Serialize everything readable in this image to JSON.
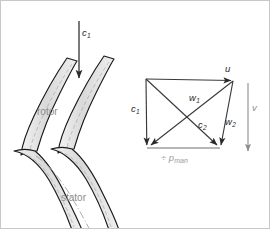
{
  "figure": {
    "type": "turbomachinery-cascade-velocity-triangle",
    "background": "#ffffff",
    "border_color": "#c8c8c8",
    "width": 270,
    "height": 229
  },
  "cascade": {
    "inlet_arrow": {
      "label": "c",
      "sub": "1",
      "name": "inlet-absolute-velocity",
      "x": 78,
      "y1": 20,
      "y2": 78,
      "color": "#2b2b2b"
    },
    "rotor_label": "rotor",
    "stator_label": "stator",
    "blade_fill": "#dcdcdc",
    "blade_stroke": "#1a1a1a",
    "centerline_color": "#9a9a9a",
    "label_color": "#8c8c8c"
  },
  "triangle": {
    "vertices": {
      "top_left": {
        "x": 145,
        "y": 78
      },
      "top_right": {
        "x": 232,
        "y": 80
      },
      "bottom_right": {
        "x": 219,
        "y": 147
      },
      "bottom_left": {
        "x": 146,
        "y": 147
      }
    },
    "stroke": "#3a3a3a",
    "vectors": [
      {
        "name": "blade-speed-u",
        "label": "u",
        "sub": "",
        "lx": 224,
        "ly": 64
      },
      {
        "name": "absolute-velocity-c1",
        "label": "c",
        "sub": "1",
        "lx": 131,
        "ly": 108
      },
      {
        "name": "relative-velocity-w1",
        "label": "w",
        "sub": "1",
        "lx": 189,
        "ly": 96
      },
      {
        "name": "absolute-velocity-c2",
        "label": "c",
        "sub": "2",
        "lx": 199,
        "ly": 122
      },
      {
        "name": "relative-velocity-w2",
        "label": "w",
        "sub": "2",
        "lx": 226,
        "ly": 119
      },
      {
        "name": "axial-velocity-v",
        "label": "v",
        "sub": "",
        "lx": 252,
        "ly": 105
      }
    ],
    "axial_arrow": {
      "x": 247,
      "y1": 82,
      "y2": 152,
      "color": "#8c8c8c"
    },
    "base_label": {
      "symbol": "÷",
      "var": "p",
      "sub": "man",
      "x": 162,
      "y": 152
    }
  }
}
